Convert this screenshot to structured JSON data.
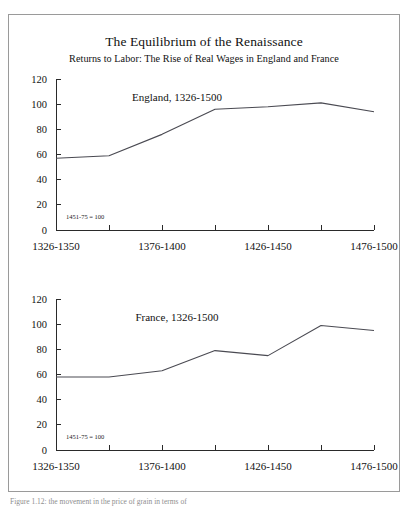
{
  "figure": {
    "title": "The Equilibrium of the Renaissance",
    "subtitle": "Returns to Labor: The Rise of Real Wages in England and France",
    "caption": "Figure 1.12: the movement in the price of grain in terms of",
    "border_color": "#9a9a9a",
    "line_color": "#4a4a52",
    "axis_color": "#2a2a2a"
  },
  "chart_data": [
    {
      "type": "line",
      "title": "England, 1326-1500",
      "annotation": "1451-75 = 100",
      "xlabel": "",
      "ylabel": "",
      "ylim": [
        0,
        120
      ],
      "yticks": [
        0,
        20,
        40,
        60,
        80,
        100,
        120
      ],
      "ytick_labels": [
        "0",
        "20",
        "40",
        "60",
        "80",
        "100",
        "120"
      ],
      "grid": false,
      "legend": "none",
      "categories": [
        "1326-1350",
        "1351-1375",
        "1376-1400",
        "1401-1425",
        "1426-1450",
        "1451-1475",
        "1476-1500"
      ],
      "xtick_labels": [
        "1326-1350",
        "1376-1400",
        "1426-1450",
        "1476-1500"
      ],
      "xtick_label_indices": [
        0,
        2,
        4,
        6
      ],
      "values": [
        57,
        59,
        76,
        96,
        98,
        101,
        94
      ]
    },
    {
      "type": "line",
      "title": "France, 1326-1500",
      "annotation": "1451-75 = 100",
      "xlabel": "",
      "ylabel": "",
      "ylim": [
        0,
        120
      ],
      "yticks": [
        0,
        20,
        40,
        60,
        80,
        100,
        120
      ],
      "ytick_labels": [
        "0",
        "20",
        "40",
        "60",
        "80",
        "100",
        "120"
      ],
      "grid": false,
      "legend": "none",
      "categories": [
        "1326-1350",
        "1351-1375",
        "1376-1400",
        "1401-1425",
        "1426-1450",
        "1451-1475",
        "1476-1500"
      ],
      "xtick_labels": [
        "1326-1350",
        "1376-1400",
        "1426-1450",
        "1476-1500"
      ],
      "xtick_label_indices": [
        0,
        2,
        4,
        6
      ],
      "values": [
        58,
        58,
        63,
        79,
        75,
        99,
        95
      ]
    }
  ]
}
